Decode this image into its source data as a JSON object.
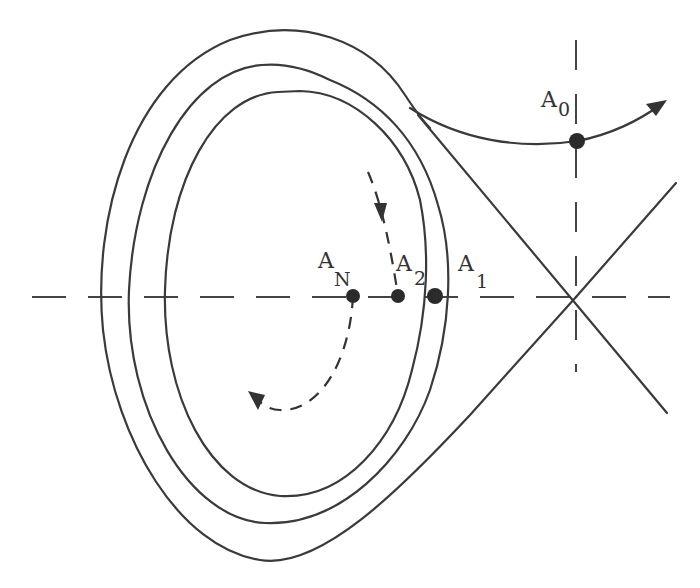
{
  "diagram": {
    "type": "phase-portrait",
    "labels": {
      "a0": {
        "main": "A",
        "sub": "0"
      },
      "a1": {
        "main": "A",
        "sub": "1"
      },
      "a2": {
        "main": "A",
        "sub": "2"
      },
      "an": {
        "main": "A",
        "sub": "N"
      }
    },
    "points": [
      {
        "name": "A0",
        "x": 577,
        "y": 141
      },
      {
        "name": "A1",
        "x": 435,
        "y": 296
      },
      {
        "name": "A2",
        "x": 398,
        "y": 296
      },
      {
        "name": "AN",
        "x": 353,
        "y": 296
      }
    ],
    "saddle": {
      "x": 576,
      "y": 297
    },
    "colors": {
      "line": "#3a3a3a",
      "point": "#2b2b2b",
      "background": "#ffffff"
    }
  }
}
